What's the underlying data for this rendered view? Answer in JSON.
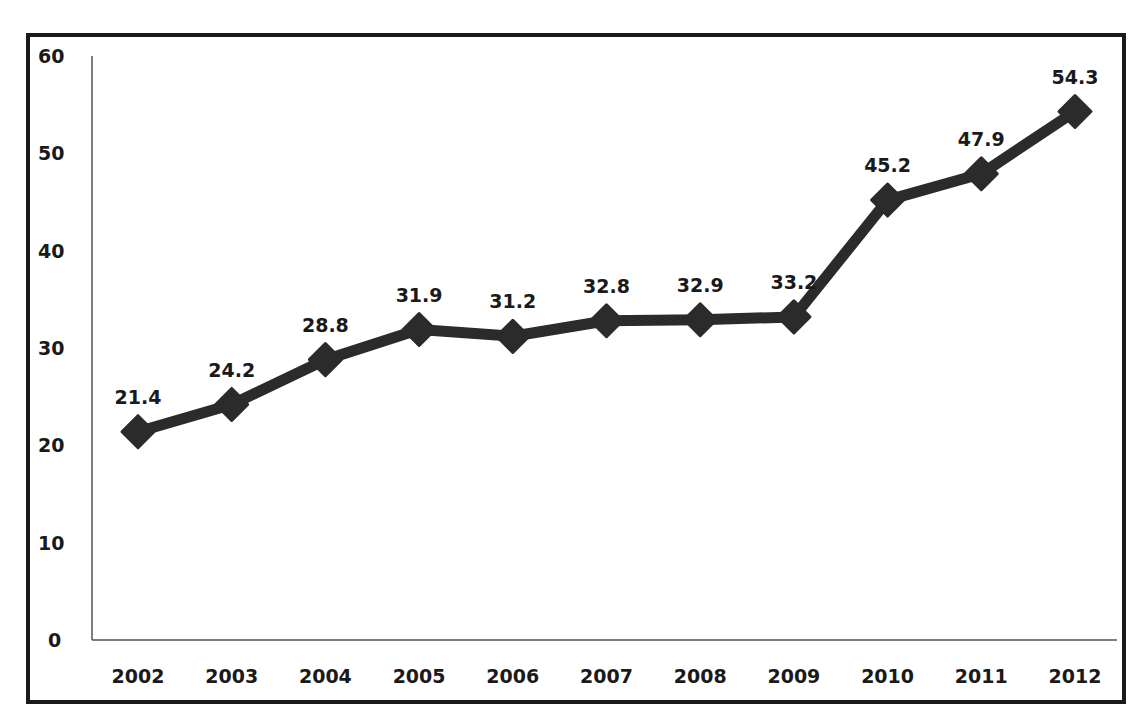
{
  "chart_data": {
    "type": "line",
    "title": "",
    "xlabel": "",
    "ylabel": "",
    "categories": [
      "2002",
      "2003",
      "2004",
      "2005",
      "2006",
      "2007",
      "2008",
      "2009",
      "2010",
      "2011",
      "2012"
    ],
    "series": [
      {
        "name": "Series 1",
        "values": [
          21.4,
          24.2,
          28.8,
          31.9,
          31.2,
          32.8,
          32.9,
          33.2,
          45.2,
          47.9,
          54.3
        ],
        "labels": [
          "21.4",
          "24.2",
          "28.8",
          "31.9",
          "31.2",
          "32.8",
          "32.9",
          "33.2",
          "45.2",
          "47.9",
          "54.3"
        ],
        "marker": "diamond",
        "color": "#2b2b2b"
      }
    ],
    "yticks": [
      "0",
      "10",
      "20",
      "30",
      "40",
      "50",
      "60"
    ],
    "ylim": [
      0,
      60
    ],
    "grid": false,
    "legend": "none",
    "data_labels": true
  },
  "colors": {
    "line": "#2b2b2b",
    "frame": "#1a1a1a",
    "axis": "#555555",
    "background": "#ffffff"
  }
}
